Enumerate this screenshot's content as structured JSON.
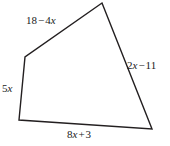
{
  "figure": {
    "type": "quadrilateral",
    "stroke_color": "#231f20",
    "fill_color": "#ffffff",
    "stroke_width": 1.4,
    "vertices": [
      {
        "name": "top",
        "x": 102,
        "y": 3
      },
      {
        "name": "bottom-right",
        "x": 152,
        "y": 129
      },
      {
        "name": "bottom-left",
        "x": 19,
        "y": 120
      },
      {
        "name": "left",
        "x": 25,
        "y": 57
      }
    ],
    "path": "M 102 3 L 152 129 L 19 120 L 25 57 Z",
    "sides": [
      {
        "id": "top-left-side",
        "label": "18 − 4x",
        "parts": {
          "first": "18",
          "operator": "−",
          "second": "4",
          "variable": "x"
        },
        "from": "left",
        "to": "top"
      },
      {
        "id": "right-side",
        "label": "2x − 11",
        "parts": {
          "first": "2",
          "variable": "x",
          "operator": "−",
          "second": "11"
        },
        "from": "top",
        "to": "bottom-right"
      },
      {
        "id": "left-side",
        "label": "5x",
        "parts": {
          "first": "5",
          "variable": "x"
        },
        "from": "bottom-left",
        "to": "left"
      },
      {
        "id": "bottom-side",
        "label": "8x + 3",
        "parts": {
          "first": "8",
          "variable": "x",
          "operator": "+",
          "second": "3"
        },
        "from": "bottom-left",
        "to": "bottom-right"
      }
    ]
  }
}
